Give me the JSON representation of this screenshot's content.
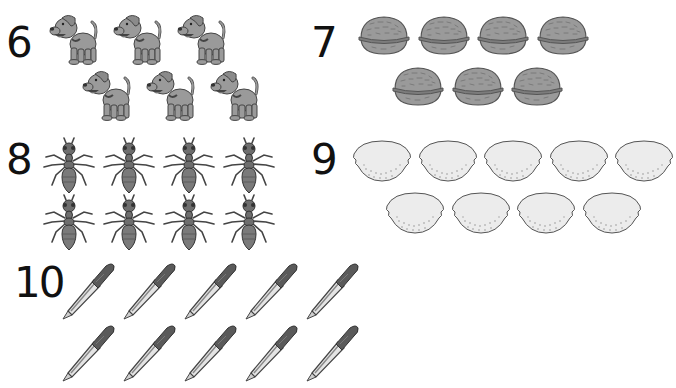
{
  "worksheet": {
    "type": "counting-exercise",
    "exercises": [
      {
        "number": "6",
        "object": "dog",
        "count": 6,
        "rows": [
          3,
          3
        ]
      },
      {
        "number": "7",
        "object": "walnut",
        "count": 7,
        "rows": [
          4,
          3
        ]
      },
      {
        "number": "8",
        "object": "ant",
        "count": 8,
        "rows": [
          4,
          4
        ]
      },
      {
        "number": "9",
        "object": "lemon",
        "count": 9,
        "rows": [
          5,
          4
        ]
      },
      {
        "number": "10",
        "object": "pen",
        "count": 10,
        "rows": [
          5,
          5
        ]
      }
    ]
  },
  "colors": {
    "text": "#111111",
    "icon_fill": "#9a9a9a",
    "icon_dark": "#555555",
    "lemon_fill": "#ececec",
    "background": "#ffffff"
  }
}
